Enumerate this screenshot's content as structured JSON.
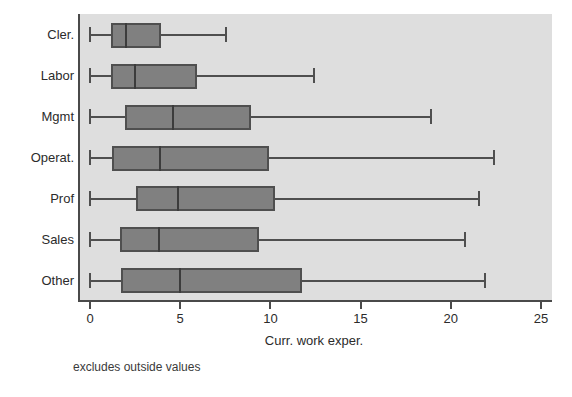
{
  "chart_data": {
    "type": "box",
    "title": "",
    "xlabel": "Curr. work exper.",
    "ylabel": "",
    "footnote": "excludes outside values",
    "orientation": "horizontal",
    "xlim": [
      0,
      26.0
    ],
    "xticks": [
      0,
      5,
      10,
      15,
      20,
      25
    ],
    "xtick_labels": [
      "0",
      "5",
      "10",
      "15",
      "20",
      "25"
    ],
    "grid": false,
    "legend": "none",
    "categories": [
      "Cler.",
      "Labor",
      "Mgmt",
      "Operat.",
      "Prof",
      "Sales",
      "Other"
    ],
    "boxes": [
      {
        "category": "Cler.",
        "lower_whisker": 0.0,
        "q1": 1.2,
        "median": 2.0,
        "q3": 4.0,
        "upper_whisker": 7.65
      },
      {
        "category": "Labor",
        "lower_whisker": 0.0,
        "q1": 1.2,
        "median": 2.5,
        "q3": 6.0,
        "upper_whisker": 12.5
      },
      {
        "category": "Mgmt",
        "lower_whisker": 0.0,
        "q1": 2.0,
        "median": 4.6,
        "q3": 9.0,
        "upper_whisker": 19.0
      },
      {
        "category": "Operat.",
        "lower_whisker": 0.0,
        "q1": 1.3,
        "median": 3.9,
        "q3": 10.0,
        "upper_whisker": 22.5
      },
      {
        "category": "Prof",
        "lower_whisker": 0.0,
        "q1": 2.6,
        "median": 4.9,
        "q3": 10.3,
        "upper_whisker": 21.7
      },
      {
        "category": "Sales",
        "lower_whisker": 0.0,
        "q1": 1.7,
        "median": 3.8,
        "q3": 9.4,
        "upper_whisker": 20.9
      },
      {
        "category": "Other",
        "lower_whisker": 0.0,
        "q1": 1.8,
        "median": 5.0,
        "q3": 11.8,
        "upper_whisker": 22.0
      }
    ],
    "colors": {
      "panel_background": "#dedede",
      "figure_background": "#ffffff",
      "box_fill": "#808080",
      "box_border": "#4f4f4f",
      "median": "#3c3c3c",
      "whisker": "#4f4f4f",
      "axis": "#4a4a4a",
      "text": "#2b2b2b"
    }
  }
}
